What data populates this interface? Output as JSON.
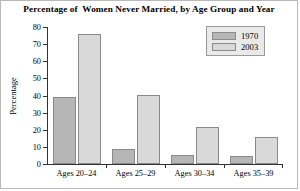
{
  "chart_data": {
    "type": "bar",
    "title": "Percentage of  Women Never Married, by Age Group and Year",
    "xlabel": "",
    "ylabel": "Percentage",
    "categories": [
      "Ages 20–24",
      "Ages 25–29",
      "Ages 30–34",
      "Ages 35–39"
    ],
    "series": [
      {
        "name": "1970",
        "values": [
          39,
          9,
          5.5,
          4.5
        ],
        "color": "#b6b6b6"
      },
      {
        "name": "2003",
        "values": [
          76,
          40.5,
          21.5,
          16
        ],
        "color": "#d9d9d9"
      }
    ],
    "ylim": [
      0,
      80
    ],
    "yticks": [
      0,
      10,
      20,
      30,
      40,
      50,
      60,
      70,
      80
    ],
    "grid": false,
    "legend_position": "top-right"
  }
}
